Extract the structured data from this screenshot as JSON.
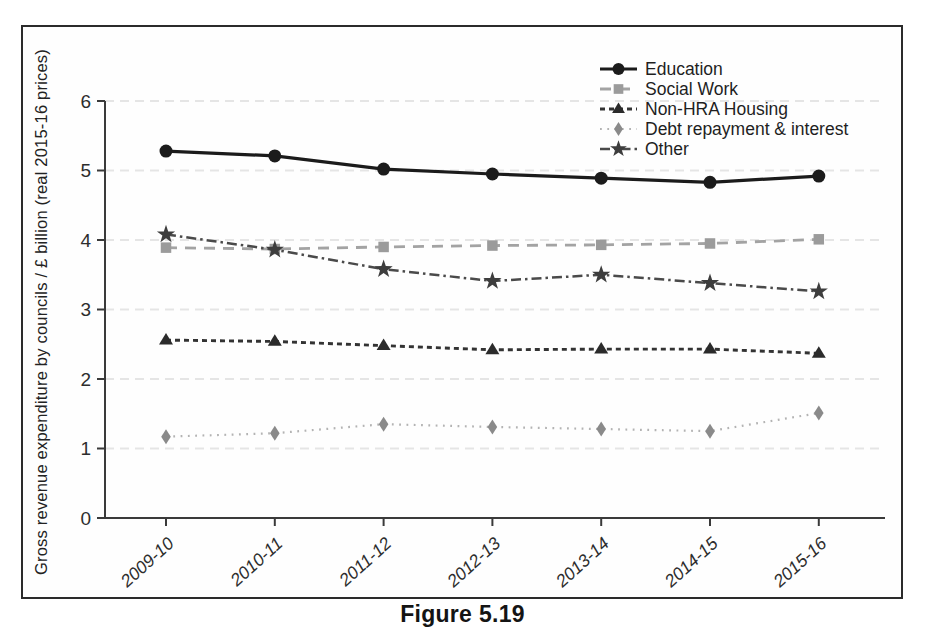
{
  "caption": "Figure 5.19",
  "chart_data": {
    "type": "line",
    "title": "",
    "xlabel": "",
    "ylabel": "Gross revenue expenditure by councils / £ billion (real 2015-16 prices)",
    "ylim": [
      0,
      6
    ],
    "yticks": [
      0,
      1,
      2,
      3,
      4,
      5,
      6
    ],
    "grid": "faint-horizontal-at-integers",
    "legend_position": "top-right-inside",
    "categories": [
      "2009-10",
      "2010-11",
      "2011-12",
      "2012-13",
      "2013-14",
      "2014-15",
      "2015-16"
    ],
    "series": [
      {
        "name": "Education",
        "marker": "circle",
        "line_style": "solid",
        "color": "#1b1b1b",
        "line_color": "#1b1b1b",
        "values": [
          5.28,
          5.21,
          5.02,
          4.95,
          4.89,
          4.83,
          4.92
        ]
      },
      {
        "name": "Social Work",
        "marker": "square",
        "line_style": "dashed",
        "color": "#9b9b9b",
        "line_color": "#a3a3a3",
        "values": [
          3.89,
          3.87,
          3.9,
          3.92,
          3.93,
          3.95,
          4.01
        ]
      },
      {
        "name": "Non-HRA Housing",
        "marker": "triangle",
        "line_style": "short-dash",
        "color": "#2b2b2b",
        "line_color": "#333333",
        "values": [
          2.56,
          2.54,
          2.48,
          2.42,
          2.43,
          2.43,
          2.37
        ]
      },
      {
        "name": "Debt repayment & interest",
        "marker": "diamond",
        "line_style": "dotted",
        "color": "#8a8a8a",
        "line_color": "#b3b3b3",
        "values": [
          1.17,
          1.22,
          1.35,
          1.31,
          1.28,
          1.25,
          1.51
        ]
      },
      {
        "name": "Other",
        "marker": "star",
        "line_style": "dash-dot",
        "color": "#3d3d3d",
        "line_color": "#4a4a4a",
        "values": [
          4.08,
          3.86,
          3.58,
          3.41,
          3.5,
          3.38,
          3.26
        ]
      }
    ],
    "colors": {
      "axis": "#3a3a3a",
      "grid": "#e5e5e5",
      "tick_text": "#2d2d2d",
      "frame": "#2b2b2b",
      "caption": "#141414"
    }
  }
}
